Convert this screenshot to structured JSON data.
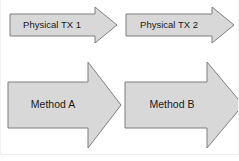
{
  "diagram": {
    "type": "block-arrow-flow",
    "canvas": {
      "width": 239,
      "height": 161,
      "background": "#ffffff"
    },
    "style": {
      "arrow_fill": "#d8d8d8",
      "arrow_stroke": "#7f7f7f",
      "label_color": "#1a1a1a",
      "frame_color": "#e8e8e8"
    },
    "rows": [
      {
        "name": "physical-tx-row",
        "arrows": [
          {
            "id": "physical-tx-1",
            "label": "Physical TX 1"
          },
          {
            "id": "physical-tx-2",
            "label": "Physical TX 2"
          }
        ]
      },
      {
        "name": "method-row",
        "arrows": [
          {
            "id": "method-a",
            "label": "Method A"
          },
          {
            "id": "method-b",
            "label": "Method B"
          }
        ]
      }
    ]
  }
}
